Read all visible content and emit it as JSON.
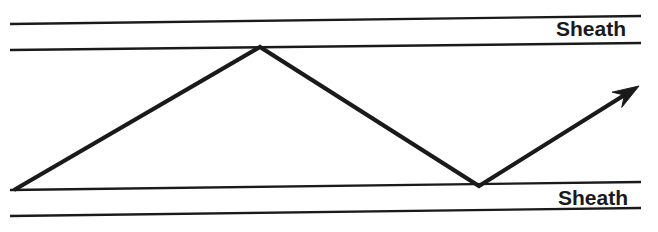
{
  "figure": {
    "type": "ray-propagation-diagram",
    "background_color": "#ffffff",
    "ink_color": "#1a1a1a",
    "width": 658,
    "height": 232
  },
  "labels": {
    "top_sheath": "Sheath",
    "bottom_sheath": "Sheath"
  },
  "boundary_lines": [
    {
      "name": "top-outer-sheath-line",
      "x1": 10,
      "y1": 24,
      "x2": 641,
      "y2": 16,
      "thickness": 2.4
    },
    {
      "name": "top-inner-core-line",
      "x1": 10,
      "y1": 50,
      "x2": 641,
      "y2": 43,
      "thickness": 2.4
    },
    {
      "name": "bottom-inner-core-line",
      "x1": 10,
      "y1": 190,
      "x2": 641,
      "y2": 182,
      "thickness": 2.4
    },
    {
      "name": "bottom-outer-sheath-line",
      "x1": 10,
      "y1": 216,
      "x2": 641,
      "y2": 208,
      "thickness": 2.4
    }
  ],
  "ray": {
    "name": "zigzag-light-ray",
    "thickness": 4.2,
    "points": [
      {
        "label": "entry-point",
        "x": 14,
        "y": 190
      },
      {
        "label": "upper-reflection",
        "x": 260,
        "y": 47
      },
      {
        "label": "lower-reflection",
        "x": 479,
        "y": 186
      },
      {
        "label": "exit-arrow-tip",
        "x": 639,
        "y": 86
      }
    ],
    "arrowhead": {
      "name": "ray-direction-arrowhead",
      "tip_x": 639,
      "tip_y": 86,
      "length": 26,
      "half_width": 9
    }
  }
}
